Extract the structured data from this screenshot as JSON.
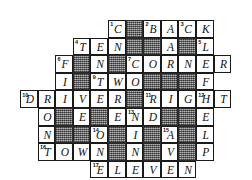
{
  "puzzle": {
    "title": "Crossword Grid",
    "columns": 11,
    "rows": 9,
    "cell_size": 17.6,
    "ink_color": "#111111",
    "block_color": "#8a8a8a",
    "background_color": "#ffffff",
    "cells": [
      {
        "r": 0,
        "c": 5,
        "letter": "C",
        "num": "1",
        "block": false
      },
      {
        "r": 0,
        "c": 6,
        "letter": "",
        "num": "",
        "block": true
      },
      {
        "r": 0,
        "c": 7,
        "letter": "B",
        "num": "2",
        "block": false
      },
      {
        "r": 0,
        "c": 8,
        "letter": "A",
        "num": "",
        "block": false
      },
      {
        "r": 0,
        "c": 9,
        "letter": "C",
        "num": "3",
        "block": false
      },
      {
        "r": 0,
        "c": 10,
        "letter": "K",
        "num": "",
        "block": false
      },
      {
        "r": 1,
        "c": 3,
        "letter": "T",
        "num": "4",
        "block": false
      },
      {
        "r": 1,
        "c": 4,
        "letter": "E",
        "num": "",
        "block": false
      },
      {
        "r": 1,
        "c": 5,
        "letter": "N",
        "num": "",
        "block": false
      },
      {
        "r": 1,
        "c": 6,
        "letter": "",
        "num": "",
        "block": true
      },
      {
        "r": 1,
        "c": 7,
        "letter": "",
        "num": "",
        "block": true
      },
      {
        "r": 1,
        "c": 8,
        "letter": "A",
        "num": "",
        "block": false
      },
      {
        "r": 1,
        "c": 9,
        "letter": "",
        "num": "",
        "block": true
      },
      {
        "r": 1,
        "c": 10,
        "letter": "L",
        "num": "5",
        "block": false
      },
      {
        "r": 2,
        "c": 2,
        "letter": "F",
        "num": "6",
        "block": false
      },
      {
        "r": 2,
        "c": 3,
        "letter": "",
        "num": "",
        "block": true
      },
      {
        "r": 2,
        "c": 4,
        "letter": "N",
        "num": "",
        "block": false
      },
      {
        "r": 2,
        "c": 5,
        "letter": "",
        "num": "",
        "block": true
      },
      {
        "r": 2,
        "c": 6,
        "letter": "C",
        "num": "7",
        "block": false
      },
      {
        "r": 2,
        "c": 7,
        "letter": "O",
        "num": "",
        "block": false
      },
      {
        "r": 2,
        "c": 8,
        "letter": "R",
        "num": "",
        "block": false
      },
      {
        "r": 2,
        "c": 9,
        "letter": "N",
        "num": "",
        "block": false
      },
      {
        "r": 2,
        "c": 10,
        "letter": "E",
        "num": "",
        "block": false
      },
      {
        "r": 2,
        "c": 11,
        "letter": "R",
        "num": "",
        "block": false
      },
      {
        "r": 3,
        "c": 2,
        "letter": "I",
        "num": "",
        "block": false
      },
      {
        "r": 3,
        "c": 3,
        "letter": "",
        "num": "",
        "block": true
      },
      {
        "r": 3,
        "c": 4,
        "letter": "T",
        "num": "9",
        "block": false
      },
      {
        "r": 3,
        "c": 5,
        "letter": "W",
        "num": "",
        "block": false
      },
      {
        "r": 3,
        "c": 6,
        "letter": "O",
        "num": "",
        "block": false
      },
      {
        "r": 3,
        "c": 7,
        "letter": "",
        "num": "",
        "block": true
      },
      {
        "r": 3,
        "c": 8,
        "letter": "",
        "num": "",
        "block": true
      },
      {
        "r": 3,
        "c": 9,
        "letter": "",
        "num": "",
        "block": true
      },
      {
        "r": 3,
        "c": 10,
        "letter": "F",
        "num": "",
        "block": false
      },
      {
        "r": 4,
        "c": 0,
        "letter": "D",
        "num": "10",
        "block": false
      },
      {
        "r": 4,
        "c": 1,
        "letter": "R",
        "num": "",
        "block": false
      },
      {
        "r": 4,
        "c": 2,
        "letter": "I",
        "num": "",
        "block": false
      },
      {
        "r": 4,
        "c": 3,
        "letter": "V",
        "num": "",
        "block": false
      },
      {
        "r": 4,
        "c": 4,
        "letter": "E",
        "num": "",
        "block": false
      },
      {
        "r": 4,
        "c": 5,
        "letter": "R",
        "num": "",
        "block": false
      },
      {
        "r": 4,
        "c": 6,
        "letter": "",
        "num": "",
        "block": true
      },
      {
        "r": 4,
        "c": 7,
        "letter": "R",
        "num": "11",
        "block": false
      },
      {
        "r": 4,
        "c": 8,
        "letter": "I",
        "num": "",
        "block": false
      },
      {
        "r": 4,
        "c": 9,
        "letter": "G",
        "num": "",
        "block": false
      },
      {
        "r": 4,
        "c": 10,
        "letter": "H",
        "num": "12",
        "block": false
      },
      {
        "r": 4,
        "c": 11,
        "letter": "T",
        "num": "",
        "block": false
      },
      {
        "r": 5,
        "c": 1,
        "letter": "O",
        "num": "",
        "block": false
      },
      {
        "r": 5,
        "c": 2,
        "letter": "",
        "num": "",
        "block": true
      },
      {
        "r": 5,
        "c": 3,
        "letter": "E",
        "num": "",
        "block": false
      },
      {
        "r": 5,
        "c": 4,
        "letter": "",
        "num": "",
        "block": true
      },
      {
        "r": 5,
        "c": 5,
        "letter": "E",
        "num": "",
        "block": false
      },
      {
        "r": 5,
        "c": 6,
        "letter": "N",
        "num": "13",
        "block": false
      },
      {
        "r": 5,
        "c": 7,
        "letter": "D",
        "num": "",
        "block": false
      },
      {
        "r": 5,
        "c": 8,
        "letter": "",
        "num": "",
        "block": true
      },
      {
        "r": 5,
        "c": 9,
        "letter": "",
        "num": "",
        "block": true
      },
      {
        "r": 5,
        "c": 10,
        "letter": "E",
        "num": "",
        "block": false
      },
      {
        "r": 6,
        "c": 1,
        "letter": "N",
        "num": "",
        "block": false
      },
      {
        "r": 6,
        "c": 2,
        "letter": "",
        "num": "",
        "block": true
      },
      {
        "r": 6,
        "c": 3,
        "letter": "",
        "num": "",
        "block": true
      },
      {
        "r": 6,
        "c": 4,
        "letter": "O",
        "num": "14",
        "block": false
      },
      {
        "r": 6,
        "c": 5,
        "letter": "",
        "num": "",
        "block": true
      },
      {
        "r": 6,
        "c": 6,
        "letter": "I",
        "num": "",
        "block": false
      },
      {
        "r": 6,
        "c": 7,
        "letter": "",
        "num": "",
        "block": true
      },
      {
        "r": 6,
        "c": 8,
        "letter": "A",
        "num": "15",
        "block": false
      },
      {
        "r": 6,
        "c": 9,
        "letter": "",
        "num": "",
        "block": true
      },
      {
        "r": 6,
        "c": 10,
        "letter": "L",
        "num": "",
        "block": false
      },
      {
        "r": 7,
        "c": 1,
        "letter": "T",
        "num": "16",
        "block": false
      },
      {
        "r": 7,
        "c": 2,
        "letter": "O",
        "num": "",
        "block": false
      },
      {
        "r": 7,
        "c": 3,
        "letter": "W",
        "num": "",
        "block": false
      },
      {
        "r": 7,
        "c": 4,
        "letter": "N",
        "num": "",
        "block": false
      },
      {
        "r": 7,
        "c": 5,
        "letter": "",
        "num": "",
        "block": true
      },
      {
        "r": 7,
        "c": 6,
        "letter": "N",
        "num": "",
        "block": false
      },
      {
        "r": 7,
        "c": 7,
        "letter": "",
        "num": "",
        "block": true
      },
      {
        "r": 7,
        "c": 8,
        "letter": "V",
        "num": "",
        "block": false
      },
      {
        "r": 7,
        "c": 9,
        "letter": "",
        "num": "",
        "block": true
      },
      {
        "r": 7,
        "c": 10,
        "letter": "P",
        "num": "",
        "block": false
      },
      {
        "r": 8,
        "c": 4,
        "letter": "E",
        "num": "17",
        "block": false
      },
      {
        "r": 8,
        "c": 5,
        "letter": "L",
        "num": "",
        "block": false
      },
      {
        "r": 8,
        "c": 6,
        "letter": "E",
        "num": "",
        "block": false
      },
      {
        "r": 8,
        "c": 7,
        "letter": "V",
        "num": "",
        "block": false
      },
      {
        "r": 8,
        "c": 8,
        "letter": "E",
        "num": "",
        "block": false
      },
      {
        "r": 8,
        "c": 9,
        "letter": "N",
        "num": "",
        "block": false
      }
    ]
  }
}
